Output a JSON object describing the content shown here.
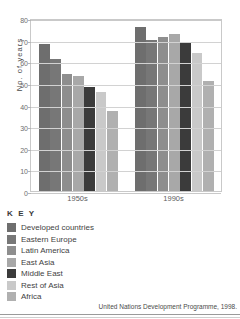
{
  "chart_data": {
    "type": "bar",
    "title": "",
    "xlabel": "",
    "ylabel": "No. of years",
    "ylim": [
      0,
      80
    ],
    "yticks": [
      0,
      10,
      20,
      30,
      40,
      50,
      60,
      70,
      80
    ],
    "grid": true,
    "legend_position": "below-left",
    "categories": [
      "1950s",
      "1990s"
    ],
    "series": [
      {
        "name": "Developed countries",
        "color": "#6e6e6e",
        "values": [
          68,
          76
        ]
      },
      {
        "name": "Eastern Europe",
        "color": "#777777",
        "values": [
          61,
          70
        ]
      },
      {
        "name": "Latin America",
        "color": "#8e8e8e",
        "values": [
          54,
          71
        ]
      },
      {
        "name": "East Asia",
        "color": "#a8a8a8",
        "values": [
          53,
          72.5
        ]
      },
      {
        "name": "Middle East",
        "color": "#3b3b3b",
        "values": [
          48,
          69
        ]
      },
      {
        "name": "Rest of Asia",
        "color": "#c9c9c9",
        "values": [
          46,
          64
        ]
      },
      {
        "name": "Africa",
        "color": "#b0b0b0",
        "values": [
          37,
          51
        ]
      }
    ]
  },
  "key": {
    "title": "K E Y"
  },
  "source": {
    "text": "United Nations Development Programme, 1998."
  }
}
